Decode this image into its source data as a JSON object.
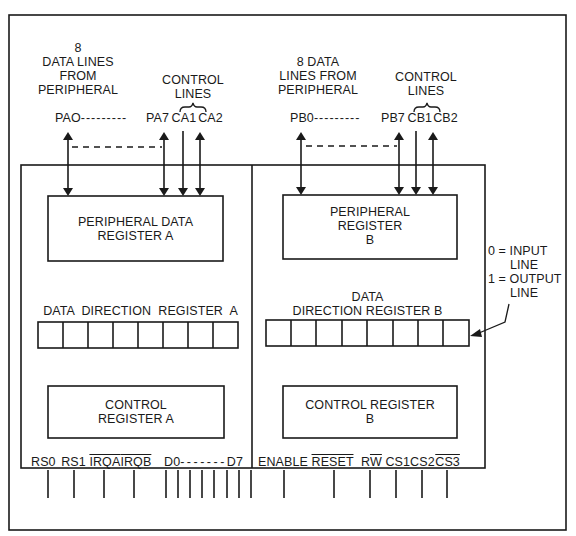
{
  "diagram": {
    "title": "",
    "port_a": {
      "data_lines_label": [
        "8",
        "DATA LINES",
        "FROM",
        "PERIPHERAL"
      ],
      "control_lines_label": [
        "CONTROL",
        "LINES"
      ],
      "pin_first": "PAO",
      "pin_dash": "---------",
      "pin_last": "PA7",
      "ctrl1": "CA1",
      "ctrl2": "CA2"
    },
    "port_b": {
      "data_lines_label": [
        "8 DATA",
        "LINES FROM",
        "PERIPHERAL"
      ],
      "control_lines_label": [
        "CONTROL",
        "LINES"
      ],
      "pin_first": "PB0",
      "pin_dash": "---------",
      "pin_last": "PB7",
      "ctrl1": "CB1",
      "ctrl2": "CB2"
    },
    "registers": {
      "pdr_a": [
        "PERIPHERAL DATA",
        "REGISTER A"
      ],
      "pr_b": [
        "PERIPHERAL",
        "REGISTER",
        "B"
      ],
      "ddr_a": "DATA  DIRECTION  REGISTER  A",
      "ddr_b": [
        "DATA",
        "DIRECTION REGISTER B"
      ],
      "cr_a": [
        "CONTROL",
        "REGISTER A"
      ],
      "cr_b": [
        "CONTROL REGISTER",
        "B"
      ],
      "ddr_cells": 8
    },
    "legend": {
      "line1": "0 = INPUT",
      "line2": "LINE",
      "line3": "1 = OUTPUT",
      "line4": "LINE"
    },
    "bottom_pins": {
      "rs0": "RS0",
      "rs1": "RS1",
      "irqa": "IRQA",
      "irqb": "IRQB",
      "d0": "D0",
      "d_dash": "-------",
      "d7": "D7",
      "enable": "ENABLE",
      "reset": "RESET",
      "r": "R",
      "w": "W",
      "cs1": "CS1",
      "cs2": "CS2",
      "cs3": "CS3"
    }
  }
}
